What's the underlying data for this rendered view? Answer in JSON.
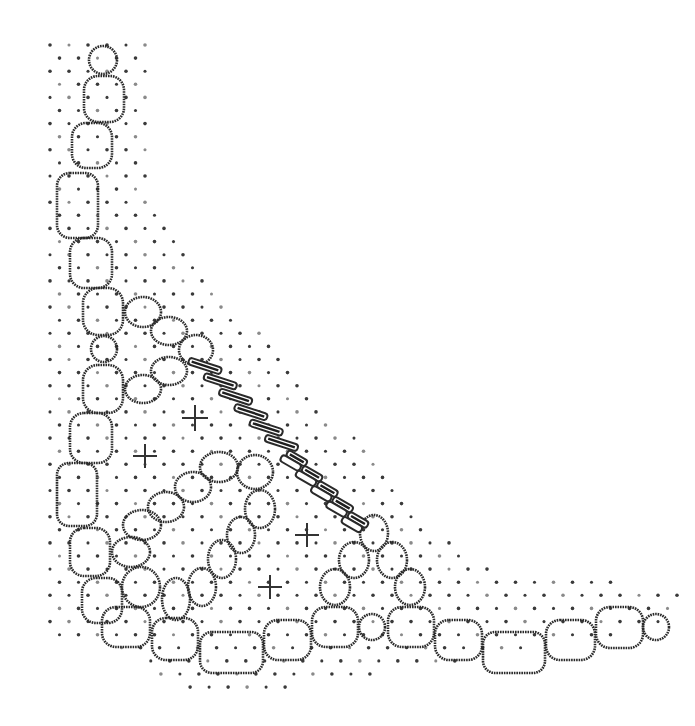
{
  "diagram": {
    "title": "",
    "kind": "bobbin lace pricking / pattern diagram",
    "colors": {
      "background": "#ffffff",
      "ink": "#2a2a2a",
      "dot": "#3a3a3a"
    },
    "left_chain": [
      {
        "type": "circle",
        "cx": 103,
        "cy": 60,
        "r": 14
      },
      {
        "type": "rrect",
        "x": 84,
        "y": 76,
        "w": 40,
        "h": 46,
        "rx": 14
      },
      {
        "type": "rrect",
        "x": 72,
        "y": 123,
        "w": 40,
        "h": 45,
        "rx": 14
      },
      {
        "type": "rrect",
        "x": 57,
        "y": 173,
        "w": 41,
        "h": 65,
        "rx": 13
      },
      {
        "type": "rrect",
        "x": 70,
        "y": 238,
        "w": 42,
        "h": 50,
        "rx": 14
      },
      {
        "type": "rrect",
        "x": 83,
        "y": 288,
        "w": 40,
        "h": 47,
        "rx": 15
      },
      {
        "type": "circle",
        "cx": 104,
        "cy": 349,
        "r": 13
      },
      {
        "type": "rrect",
        "x": 83,
        "y": 365,
        "w": 40,
        "h": 48,
        "rx": 15
      },
      {
        "type": "rrect",
        "x": 70,
        "y": 413,
        "w": 42,
        "h": 50,
        "rx": 14
      },
      {
        "type": "rrect",
        "x": 57,
        "y": 463,
        "w": 40,
        "h": 63,
        "rx": 12
      },
      {
        "type": "rrect",
        "x": 70,
        "y": 528,
        "w": 40,
        "h": 48,
        "rx": 14
      },
      {
        "type": "rrect",
        "x": 82,
        "y": 578,
        "w": 40,
        "h": 45,
        "rx": 14
      }
    ],
    "side_loop": [
      {
        "type": "ellipse",
        "cx": 143,
        "cy": 312,
        "rx": 18,
        "ry": 15
      },
      {
        "type": "ellipse",
        "cx": 169,
        "cy": 331,
        "rx": 18,
        "ry": 14
      },
      {
        "type": "ellipse",
        "cx": 196,
        "cy": 350,
        "rx": 17,
        "ry": 15
      },
      {
        "type": "ellipse",
        "cx": 169,
        "cy": 371,
        "rx": 18,
        "ry": 14
      },
      {
        "type": "ellipse",
        "cx": 143,
        "cy": 389,
        "rx": 18,
        "ry": 14
      }
    ],
    "bottom_chain": [
      {
        "type": "rrect",
        "x": 102,
        "y": 607,
        "w": 48,
        "h": 40,
        "rx": 14
      },
      {
        "type": "rrect",
        "x": 152,
        "y": 618,
        "w": 46,
        "h": 42,
        "rx": 14
      },
      {
        "type": "rrect",
        "x": 200,
        "y": 632,
        "w": 63,
        "h": 41,
        "rx": 12
      },
      {
        "type": "rrect",
        "x": 264,
        "y": 620,
        "w": 47,
        "h": 40,
        "rx": 14
      },
      {
        "type": "rrect",
        "x": 312,
        "y": 607,
        "w": 46,
        "h": 40,
        "rx": 14
      },
      {
        "type": "circle",
        "cx": 372,
        "cy": 627,
        "r": 13
      },
      {
        "type": "rrect",
        "x": 388,
        "y": 607,
        "w": 46,
        "h": 40,
        "rx": 14
      },
      {
        "type": "rrect",
        "x": 435,
        "y": 620,
        "w": 47,
        "h": 40,
        "rx": 14
      },
      {
        "type": "rrect",
        "x": 483,
        "y": 632,
        "w": 62,
        "h": 41,
        "rx": 12
      },
      {
        "type": "rrect",
        "x": 546,
        "y": 620,
        "w": 49,
        "h": 40,
        "rx": 14
      },
      {
        "type": "rrect",
        "x": 596,
        "y": 607,
        "w": 47,
        "h": 41,
        "rx": 14
      },
      {
        "type": "circle",
        "cx": 656,
        "cy": 627,
        "r": 13
      }
    ],
    "inner_loop": [
      {
        "type": "ellipse",
        "cx": 219,
        "cy": 467,
        "rx": 19,
        "ry": 15
      },
      {
        "type": "ellipse",
        "cx": 255,
        "cy": 472,
        "rx": 18,
        "ry": 17
      },
      {
        "type": "ellipse",
        "cx": 260,
        "cy": 509,
        "rx": 15,
        "ry": 19
      },
      {
        "type": "ellipse",
        "cx": 241,
        "cy": 535,
        "rx": 14,
        "ry": 18
      },
      {
        "type": "ellipse",
        "cx": 222,
        "cy": 559,
        "rx": 14,
        "ry": 19
      },
      {
        "type": "ellipse",
        "cx": 202,
        "cy": 587,
        "rx": 14,
        "ry": 19
      },
      {
        "type": "ellipse",
        "cx": 176,
        "cy": 599,
        "rx": 14,
        "ry": 21
      },
      {
        "type": "ellipse",
        "cx": 193,
        "cy": 487,
        "rx": 18,
        "ry": 15
      },
      {
        "type": "ellipse",
        "cx": 166,
        "cy": 507,
        "rx": 18,
        "ry": 15
      },
      {
        "type": "ellipse",
        "cx": 142,
        "cy": 525,
        "rx": 19,
        "ry": 15
      },
      {
        "type": "ellipse",
        "cx": 131,
        "cy": 552,
        "rx": 19,
        "ry": 15
      },
      {
        "type": "ellipse",
        "cx": 141,
        "cy": 587,
        "rx": 19,
        "ry": 20
      }
    ],
    "triangle": [
      {
        "type": "ellipse",
        "cx": 374,
        "cy": 533,
        "rx": 14,
        "ry": 18
      },
      {
        "type": "ellipse",
        "cx": 354,
        "cy": 560,
        "rx": 15,
        "ry": 18
      },
      {
        "type": "ellipse",
        "cx": 392,
        "cy": 560,
        "rx": 15,
        "ry": 18
      },
      {
        "type": "ellipse",
        "cx": 335,
        "cy": 587,
        "rx": 15,
        "ry": 18
      },
      {
        "type": "ellipse",
        "cx": 410,
        "cy": 587,
        "rx": 15,
        "ry": 18
      }
    ],
    "braid": {
      "from": [
        205,
        366
      ],
      "to": [
        358,
        520
      ],
      "twists": 11
    },
    "pins": [
      {
        "cx": 195,
        "cy": 418,
        "size": 13
      },
      {
        "cx": 145,
        "cy": 456,
        "size": 12
      },
      {
        "cx": 307,
        "cy": 535,
        "size": 12
      },
      {
        "cx": 270,
        "cy": 587,
        "size": 12
      }
    ],
    "dot_grid": {
      "spacing": 19,
      "row_offset": 9.5,
      "y_start": 45,
      "y_end": 690,
      "left_edge": [
        [
          45,
          50
        ],
        [
          45,
          700
        ]
      ],
      "hypotenuse": [
        [
          150,
          45
        ],
        [
          150,
          210
        ],
        [
          470,
          565
        ],
        [
          680,
          590
        ]
      ],
      "bottom_edge": 690,
      "radius": 1.8
    }
  }
}
